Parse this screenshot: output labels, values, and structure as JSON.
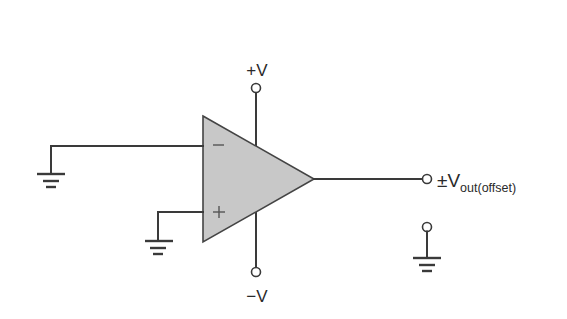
{
  "diagram": {
    "component": "operational-amplifier",
    "inputs": {
      "inverting": {
        "symbol": "−",
        "connection": "ground"
      },
      "noninverting": {
        "symbol": "+",
        "connection": "ground"
      }
    },
    "supplies": {
      "positive": {
        "label": "+V"
      },
      "negative": {
        "label": "−V"
      }
    },
    "output": {
      "label_prefix": "±V",
      "label_subscript": "out(offset)"
    },
    "colors": {
      "line": "#3a3a3a",
      "opamp_fill": "#c8c8c8",
      "background": "#ffffff"
    }
  }
}
